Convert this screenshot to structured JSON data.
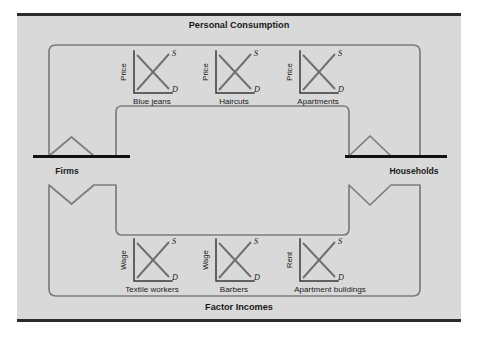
{
  "figure": {
    "name": "circular-flow-diagram",
    "background_color": "#d9d9d9",
    "page_color": "#ffffff",
    "rule_color": "#2b2b2b",
    "flow_color": "#7d7d7d",
    "node_bar_color": "#111111"
  },
  "bands": {
    "top": {
      "title": "Personal Consumption"
    },
    "bottom": {
      "title": "Factor Incomes"
    }
  },
  "nodes": {
    "left": {
      "label": "Firms"
    },
    "right": {
      "label": "Households"
    }
  },
  "curve_tags": {
    "supply": "S",
    "demand": "D"
  },
  "markets": {
    "goods": [
      {
        "axis_label": "Price",
        "market_label": "Blue jeans"
      },
      {
        "axis_label": "Price",
        "market_label": "Haircuts"
      },
      {
        "axis_label": "Price",
        "market_label": "Apartments"
      }
    ],
    "factors": [
      {
        "axis_label": "Wage",
        "market_label": "Textile workers"
      },
      {
        "axis_label": "Wage",
        "market_label": "Barbers"
      },
      {
        "axis_label": "Rent",
        "market_label": "Apartment buildings"
      }
    ]
  }
}
